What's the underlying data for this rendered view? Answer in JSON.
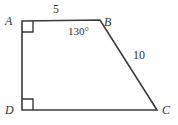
{
  "figure": {
    "kind": "geometry-diagram",
    "shape": "quadrilateral",
    "name": "ABCD",
    "background_color": "#ffffff",
    "stroke_color": "#3a3a3a",
    "text_color": "#333333",
    "stroke_width": 1.6,
    "vertices": [
      {
        "id": "A",
        "label": "A",
        "x": 22,
        "y": 21,
        "label_x": 5,
        "label_y": 15
      },
      {
        "id": "B",
        "label": "B",
        "x": 100,
        "y": 20,
        "label_x": 104,
        "label_y": 16
      },
      {
        "id": "C",
        "label": "C",
        "x": 157,
        "y": 110,
        "label_x": 162,
        "label_y": 104
      },
      {
        "id": "D",
        "label": "D",
        "x": 22,
        "y": 110,
        "label_x": 5,
        "label_y": 104
      }
    ],
    "edges": [
      {
        "id": "AB",
        "from": "A",
        "to": "B",
        "length_label": "5"
      },
      {
        "id": "BC",
        "from": "B",
        "to": "C",
        "length_label": "10"
      },
      {
        "id": "CD",
        "from": "C",
        "to": "D",
        "length_label": ""
      },
      {
        "id": "DA",
        "from": "D",
        "to": "A",
        "length_label": ""
      }
    ],
    "side_labels": [
      {
        "id": "side-ab",
        "text": "5",
        "edge": "AB",
        "x": 53,
        "y": 3
      },
      {
        "id": "side-bc",
        "text": "10",
        "edge": "BC",
        "x": 133,
        "y": 49
      }
    ],
    "angle_labels": [
      {
        "id": "angle-b",
        "text": "130°",
        "vertex": "B",
        "x": 68,
        "y": 26
      }
    ],
    "right_angle_markers": [
      {
        "id": "right-angle-a",
        "vertex": "A",
        "size": 11,
        "dir_x": 1,
        "dir_y": 1
      },
      {
        "id": "right-angle-d",
        "vertex": "D",
        "size": 11,
        "dir_x": 1,
        "dir_y": -1
      }
    ]
  },
  "chart_data": {
    "type": "diagram",
    "title": "",
    "shape": "quadrilateral ABCD",
    "labels": [
      "A",
      "B",
      "C",
      "D"
    ],
    "points": {
      "A": [
        22,
        21
      ],
      "B": [
        100,
        20
      ],
      "C": [
        157,
        110
      ],
      "D": [
        22,
        110
      ]
    },
    "measurements": [
      {
        "element": "AB",
        "value": 5,
        "unit": "",
        "display": "5"
      },
      {
        "element": "BC",
        "value": 10,
        "unit": "",
        "display": "10"
      },
      {
        "element": "angle B",
        "value": 130,
        "unit": "degrees",
        "display": "130°"
      },
      {
        "element": "angle A",
        "value": 90,
        "unit": "degrees",
        "display": "right angle mark"
      },
      {
        "element": "angle D",
        "value": 90,
        "unit": "degrees",
        "display": "right angle mark"
      }
    ]
  }
}
